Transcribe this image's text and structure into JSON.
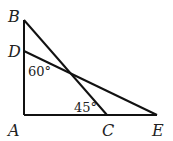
{
  "diagram": {
    "type": "geometry",
    "points": {
      "A": {
        "label": "A",
        "x": 24,
        "y": 115
      },
      "B": {
        "label": "B",
        "x": 24,
        "y": 20
      },
      "D": {
        "label": "D",
        "x": 24,
        "y": 51
      },
      "C": {
        "label": "C",
        "x": 107,
        "y": 115
      },
      "E": {
        "label": "E",
        "x": 157,
        "y": 115
      }
    },
    "segments": [
      [
        "A",
        "B"
      ],
      [
        "A",
        "E"
      ],
      [
        "B",
        "C"
      ],
      [
        "D",
        "E"
      ]
    ],
    "angles": [
      {
        "label": "60°",
        "at": "D",
        "description": "angle ADE"
      },
      {
        "label": "45°",
        "at": "C",
        "description": "angle BCA"
      }
    ],
    "colors": {
      "stroke": "#111111",
      "text": "#222222"
    }
  }
}
